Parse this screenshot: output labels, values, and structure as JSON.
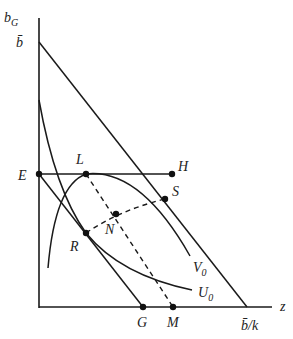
{
  "diagram": {
    "axes": {
      "y_label": "b",
      "y_label_sub": "G",
      "x_label": "z"
    },
    "intercepts": {
      "y_top": "b̄",
      "x_right": "b̄/k"
    },
    "points": {
      "E": "E",
      "L": "L",
      "H": "H",
      "S": "S",
      "N": "N",
      "R": "R",
      "G": "G",
      "M": "M"
    },
    "curves": {
      "V": "V",
      "V_sub": "0",
      "U": "U",
      "U_sub": "0"
    },
    "colors": {
      "line": "#1a1a1a",
      "text": "#222222"
    }
  }
}
